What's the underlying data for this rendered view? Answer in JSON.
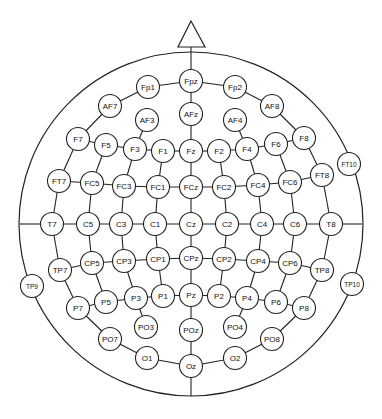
{
  "style": {
    "stroke": "#222222",
    "background": "#ffffff",
    "node_fill": "#ffffff"
  },
  "head": {
    "cx": 191,
    "cy": 224,
    "r": 172
  },
  "nose": {
    "apex": [
      191,
      21
    ],
    "left": [
      178,
      47
    ],
    "right": [
      205,
      47
    ]
  },
  "node_radius": 11.5,
  "electrodes": [
    {
      "id": "Fpz",
      "x": 191,
      "y": 81
    },
    {
      "id": "Fp1",
      "x": 148,
      "y": 87
    },
    {
      "id": "Fp2",
      "x": 235,
      "y": 87
    },
    {
      "id": "AF7",
      "x": 110,
      "y": 106
    },
    {
      "id": "AF3",
      "x": 147,
      "y": 120
    },
    {
      "id": "AFz",
      "x": 191,
      "y": 114
    },
    {
      "id": "AF4",
      "x": 235,
      "y": 120
    },
    {
      "id": "AF8",
      "x": 272,
      "y": 106
    },
    {
      "id": "F7",
      "x": 78,
      "y": 139
    },
    {
      "id": "F5",
      "x": 106,
      "y": 145
    },
    {
      "id": "F3",
      "x": 135,
      "y": 149
    },
    {
      "id": "F1",
      "x": 163,
      "y": 151
    },
    {
      "id": "Fz",
      "x": 191,
      "y": 151
    },
    {
      "id": "F2",
      "x": 219,
      "y": 151
    },
    {
      "id": "F4",
      "x": 247,
      "y": 149
    },
    {
      "id": "F6",
      "x": 276,
      "y": 144
    },
    {
      "id": "F8",
      "x": 304,
      "y": 138
    },
    {
      "id": "FT7",
      "x": 59,
      "y": 181
    },
    {
      "id": "FC5",
      "x": 92,
      "y": 183
    },
    {
      "id": "FC3",
      "x": 124,
      "y": 186
    },
    {
      "id": "FC1",
      "x": 158,
      "y": 187
    },
    {
      "id": "FCz",
      "x": 191,
      "y": 187
    },
    {
      "id": "FC2",
      "x": 224,
      "y": 187
    },
    {
      "id": "FC4",
      "x": 258,
      "y": 185
    },
    {
      "id": "FC6",
      "x": 290,
      "y": 182
    },
    {
      "id": "FT8",
      "x": 322,
      "y": 175
    },
    {
      "id": "FT10",
      "x": 349,
      "y": 164,
      "small": true
    },
    {
      "id": "T7",
      "x": 52,
      "y": 224
    },
    {
      "id": "C5",
      "x": 88,
      "y": 224
    },
    {
      "id": "C3",
      "x": 121,
      "y": 224
    },
    {
      "id": "C1",
      "x": 155,
      "y": 224
    },
    {
      "id": "Cz",
      "x": 191,
      "y": 224
    },
    {
      "id": "C2",
      "x": 227,
      "y": 224
    },
    {
      "id": "C4",
      "x": 262,
      "y": 224
    },
    {
      "id": "C6",
      "x": 295,
      "y": 224
    },
    {
      "id": "T8",
      "x": 331,
      "y": 224
    },
    {
      "id": "TP9",
      "x": 32,
      "y": 286,
      "small": true
    },
    {
      "id": "TP7",
      "x": 60,
      "y": 270
    },
    {
      "id": "CP5",
      "x": 92,
      "y": 263
    },
    {
      "id": "CP3",
      "x": 124,
      "y": 261
    },
    {
      "id": "CP1",
      "x": 158,
      "y": 259
    },
    {
      "id": "CPz",
      "x": 191,
      "y": 258
    },
    {
      "id": "CP2",
      "x": 224,
      "y": 259
    },
    {
      "id": "CP4",
      "x": 258,
      "y": 261
    },
    {
      "id": "CP6",
      "x": 290,
      "y": 263
    },
    {
      "id": "TP8",
      "x": 322,
      "y": 270
    },
    {
      "id": "TP10",
      "x": 352,
      "y": 284,
      "small": true
    },
    {
      "id": "P7",
      "x": 78,
      "y": 308
    },
    {
      "id": "P5",
      "x": 106,
      "y": 302
    },
    {
      "id": "P3",
      "x": 136,
      "y": 298
    },
    {
      "id": "P1",
      "x": 163,
      "y": 296
    },
    {
      "id": "Pz",
      "x": 191,
      "y": 295
    },
    {
      "id": "P2",
      "x": 219,
      "y": 296
    },
    {
      "id": "P4",
      "x": 247,
      "y": 298
    },
    {
      "id": "P6",
      "x": 276,
      "y": 302
    },
    {
      "id": "P8",
      "x": 304,
      "y": 308
    },
    {
      "id": "PO7",
      "x": 110,
      "y": 339
    },
    {
      "id": "PO3",
      "x": 146,
      "y": 327
    },
    {
      "id": "POz",
      "x": 191,
      "y": 330
    },
    {
      "id": "PO4",
      "x": 235,
      "y": 327
    },
    {
      "id": "PO8",
      "x": 272,
      "y": 339
    },
    {
      "id": "O1",
      "x": 147,
      "y": 358
    },
    {
      "id": "Oz",
      "x": 191,
      "y": 366
    },
    {
      "id": "O2",
      "x": 235,
      "y": 358
    }
  ],
  "chains": [
    [
      "Fp1",
      "Fpz",
      "Fp2"
    ],
    [
      "AF7",
      "Fp1"
    ],
    [
      "Fp2",
      "AF8"
    ],
    [
      "F7",
      "AF7"
    ],
    [
      "AF8",
      "F8"
    ],
    [
      "FT7",
      "F7"
    ],
    [
      "F8",
      "FT8"
    ],
    [
      "T7",
      "FT7"
    ],
    [
      "FT8",
      "T8"
    ],
    [
      "T7",
      "TP7"
    ],
    [
      "T8",
      "TP8"
    ],
    [
      "TP7",
      "P7"
    ],
    [
      "TP8",
      "P8"
    ],
    [
      "P7",
      "PO7"
    ],
    [
      "P8",
      "PO8"
    ],
    [
      "PO7",
      "O1",
      "Oz",
      "O2",
      "PO8"
    ],
    [
      "F7",
      "F5",
      "F3",
      "F1",
      "Fz",
      "F2",
      "F4",
      "F6",
      "F8"
    ],
    [
      "FT7",
      "FC5",
      "FC3",
      "FC1",
      "FCz",
      "FC2",
      "FC4",
      "FC6",
      "FT8"
    ],
    [
      "T7",
      "C5",
      "C3",
      "C1",
      "Cz",
      "C2",
      "C4",
      "C6",
      "T8"
    ],
    [
      "TP7",
      "CP5",
      "CP3",
      "CP1",
      "CPz",
      "CP2",
      "CP4",
      "CP6",
      "TP8"
    ],
    [
      "P7",
      "P5",
      "P3",
      "P1",
      "Pz",
      "P2",
      "P4",
      "P6",
      "P8"
    ],
    [
      "Fpz",
      "AFz",
      "Fz",
      "FCz",
      "Cz",
      "CPz",
      "Pz",
      "POz",
      "Oz"
    ],
    [
      "AF3",
      "F3"
    ],
    [
      "AF4",
      "F4"
    ],
    [
      "F5",
      "FC5",
      "C5",
      "CP5",
      "P5"
    ],
    [
      "F3",
      "FC3",
      "C3",
      "CP3",
      "P3",
      "PO3"
    ],
    [
      "F1",
      "FC1",
      "C1",
      "CP1",
      "P1"
    ],
    [
      "F2",
      "FC2",
      "C2",
      "CP2",
      "P2"
    ],
    [
      "F4",
      "FC4",
      "C4",
      "CP4",
      "P4",
      "PO4"
    ],
    [
      "F6",
      "FC6",
      "C6",
      "CP6",
      "P6"
    ]
  ],
  "extra_lines": [
    {
      "name": "midline-top",
      "x1": 191,
      "y1": 47,
      "x2": 191,
      "y2": 70
    },
    {
      "name": "midline-bottom",
      "x1": 191,
      "y1": 378,
      "x2": 191,
      "y2": 396
    },
    {
      "name": "horizontal-left",
      "x1": 20,
      "y1": 224,
      "x2": 40,
      "y2": 224
    },
    {
      "name": "horizontal-right",
      "x1": 343,
      "y1": 224,
      "x2": 362,
      "y2": 224
    }
  ]
}
